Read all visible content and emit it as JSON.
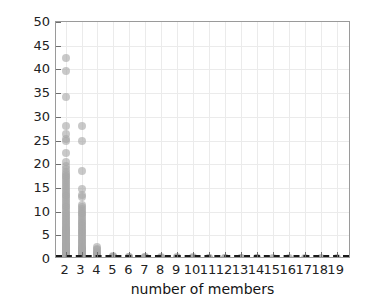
{
  "chart_data": {
    "type": "scatter",
    "title": "",
    "xlabel": "number of members",
    "ylabel": "P (%)",
    "xlim": [
      1.4,
      19.9
    ],
    "ylim": [
      0,
      50
    ],
    "grid": true,
    "legend": null,
    "marker_color": "#a8a8a8",
    "threshold_line": {
      "value": 0.8,
      "style": "dashed",
      "color": "#1a1a1a"
    },
    "y_ticks": [
      0,
      5,
      10,
      15,
      20,
      25,
      30,
      35,
      40,
      45,
      50
    ],
    "y_tick_labels": [
      "0",
      "5",
      "10",
      "15",
      "20",
      "25",
      "30",
      "35",
      "40",
      "45",
      "50"
    ],
    "x_ticks": [
      2,
      3,
      4,
      5,
      6,
      7,
      8,
      9,
      10,
      11,
      12,
      13,
      14,
      15,
      16,
      17,
      18,
      19
    ],
    "x_tick_labels": [
      "2",
      "3",
      "4",
      "5",
      "6",
      "7",
      "8",
      "9",
      "10",
      "11",
      "12",
      "13",
      "14",
      "15",
      "16",
      "17",
      "18",
      "19"
    ],
    "series": [
      {
        "name": "P by group size",
        "x": [
          2,
          2,
          2,
          2,
          2,
          2,
          2,
          2,
          2,
          2,
          2,
          2,
          2,
          2,
          2,
          2,
          2,
          2,
          2,
          2,
          2,
          2,
          2,
          2,
          2,
          2,
          2,
          2,
          2,
          2,
          2,
          2,
          2,
          2,
          2,
          2,
          2,
          2,
          2,
          2,
          2,
          2,
          2,
          2,
          2,
          2,
          2,
          2,
          2,
          2,
          2,
          2,
          2,
          2,
          2,
          2,
          2,
          2,
          2,
          2,
          2,
          2,
          2,
          2,
          2,
          2,
          2,
          2,
          2,
          2,
          2,
          2,
          2,
          2,
          2,
          2,
          2,
          2,
          2,
          2,
          2,
          2,
          2,
          2,
          2,
          2,
          2,
          2,
          2,
          2,
          3,
          3,
          3,
          3,
          3,
          3,
          3,
          3,
          3,
          3,
          3,
          3,
          3,
          3,
          3,
          3,
          3,
          3,
          3,
          3,
          3,
          3,
          3,
          3,
          3,
          3,
          3,
          3,
          3,
          3,
          3,
          3,
          3,
          3,
          3,
          3,
          3,
          3,
          3,
          3,
          3,
          3,
          3,
          3,
          3,
          3,
          3,
          3,
          3,
          3,
          3,
          3,
          3,
          3,
          3,
          3,
          3,
          3,
          3,
          3,
          4,
          4,
          4,
          4,
          4,
          4,
          4,
          4,
          4,
          4,
          4,
          4,
          4,
          4,
          4,
          4,
          4,
          4,
          5,
          5,
          5,
          5,
          5,
          5,
          5,
          5,
          6,
          6,
          6,
          6,
          6,
          6,
          7,
          7,
          7,
          7,
          7,
          8,
          8,
          8,
          8,
          8,
          9,
          9,
          9,
          9,
          10,
          10,
          10,
          10,
          11,
          11,
          11,
          12,
          12,
          12,
          13,
          13,
          13,
          14,
          14,
          14,
          15,
          15,
          16,
          16,
          17,
          17,
          18,
          18,
          19,
          19
        ],
        "y": [
          42.3,
          39.6,
          34.1,
          28.1,
          26.3,
          25.4,
          24.8,
          22.3,
          20.4,
          19.6,
          18.9,
          18.4,
          18.0,
          17.6,
          17.2,
          16.8,
          16.4,
          16.0,
          15.6,
          15.2,
          14.8,
          14.4,
          14.0,
          13.6,
          13.2,
          12.8,
          12.4,
          12.0,
          11.6,
          11.2,
          10.9,
          10.6,
          10.2,
          9.8,
          9.4,
          9.1,
          8.8,
          8.5,
          8.2,
          7.9,
          7.6,
          7.3,
          7.0,
          6.8,
          6.6,
          6.4,
          6.2,
          6.0,
          5.8,
          5.6,
          5.4,
          5.2,
          5.0,
          4.8,
          4.6,
          4.4,
          4.2,
          4.0,
          3.8,
          3.6,
          3.4,
          3.2,
          3.0,
          2.9,
          2.8,
          2.7,
          2.6,
          2.5,
          2.4,
          2.3,
          2.2,
          2.1,
          2.0,
          1.9,
          1.8,
          1.7,
          1.6,
          1.5,
          1.4,
          1.3,
          1.2,
          1.1,
          1.0,
          0.9,
          0.8,
          0.7,
          0.5,
          0.4,
          0.2,
          0.1,
          28.1,
          25.0,
          18.5,
          14.8,
          13.6,
          13.0,
          11.4,
          11.0,
          10.6,
          10.2,
          9.8,
          9.4,
          9.0,
          8.6,
          8.2,
          7.8,
          7.5,
          7.2,
          6.9,
          6.6,
          6.3,
          6.0,
          5.7,
          5.4,
          5.1,
          4.8,
          4.5,
          4.2,
          3.9,
          3.6,
          3.3,
          3.0,
          2.8,
          2.6,
          2.4,
          2.2,
          2.0,
          1.9,
          1.8,
          1.7,
          1.6,
          1.5,
          1.4,
          1.3,
          1.2,
          1.1,
          1.0,
          0.9,
          0.8,
          0.7,
          0.6,
          0.5,
          0.45,
          0.4,
          0.35,
          0.3,
          0.25,
          0.2,
          0.1,
          0.05,
          2.5,
          2.1,
          1.8,
          1.5,
          1.3,
          1.1,
          0.95,
          0.85,
          0.75,
          0.65,
          0.55,
          0.45,
          0.4,
          0.35,
          0.3,
          0.2,
          0.1,
          0.05,
          0.6,
          0.5,
          0.4,
          0.35,
          0.3,
          0.2,
          0.1,
          0.05,
          0.5,
          0.4,
          0.3,
          0.2,
          0.1,
          0.05,
          0.45,
          0.35,
          0.25,
          0.15,
          0.05,
          0.4,
          0.3,
          0.2,
          0.1,
          0.05,
          0.35,
          0.25,
          0.15,
          0.05,
          0.35,
          0.25,
          0.12,
          0.04,
          0.3,
          0.18,
          0.06,
          0.3,
          0.16,
          0.05,
          0.28,
          0.15,
          0.05,
          0.26,
          0.14,
          0.04,
          0.22,
          0.08,
          0.2,
          0.07,
          0.2,
          0.06,
          0.18,
          0.05,
          0.16,
          0.05
        ]
      }
    ]
  }
}
